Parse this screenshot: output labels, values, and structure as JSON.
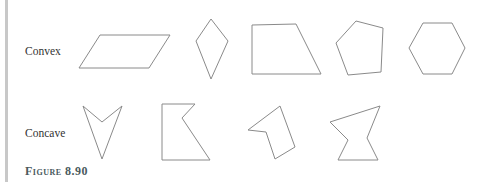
{
  "figure": {
    "label": "Figure 8.90",
    "rows": [
      {
        "label": "Convex",
        "shapes": [
          "parallelogram",
          "kite",
          "trapezoid",
          "pentagon",
          "hexagon"
        ]
      },
      {
        "label": "Concave",
        "shapes": [
          "arrowhead",
          "notched-quadrilateral",
          "notched-pentagon",
          "bowtie-hexagon"
        ]
      }
    ]
  },
  "colors": {
    "stroke": "#8a8a8a",
    "label_text": "#333333",
    "figure_label": "#4a5a5e",
    "margin_bar": "#c8c8c8"
  }
}
